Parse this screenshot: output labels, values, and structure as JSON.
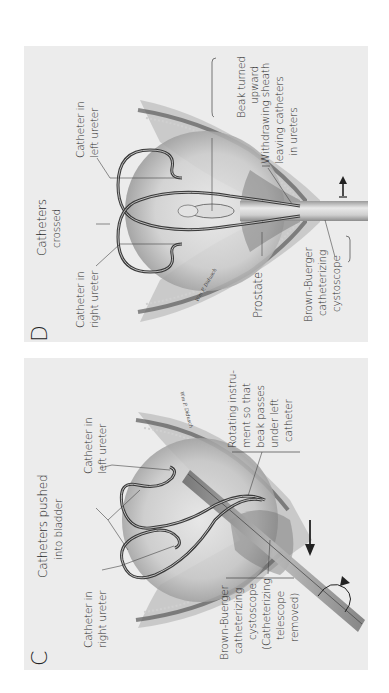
{
  "figure": {
    "orientation": "rotated-90-ccw",
    "background": "#ffffff",
    "panel_bg": "#ececec"
  },
  "panels": [
    {
      "letter": "D",
      "labels": {
        "catheters_crossed": [
          "Catheters",
          "crossed"
        ],
        "catheter_left_ureter": [
          "Catheter in",
          "left ureter"
        ],
        "catheter_right_ureter": [
          "Catheter in",
          "right ureter"
        ],
        "beak_turned_upward": [
          "Beak turned",
          "upward"
        ],
        "withdrawing_sheath": [
          "Withdrawing sheath",
          "leaving catheters",
          "in ureters"
        ],
        "prostate": [
          "Prostate"
        ],
        "cystoscope": [
          "Brown-Buerger",
          "catheterizing",
          "cystoscope"
        ]
      },
      "signature": "Wm P. Didusch"
    },
    {
      "letter": "C",
      "labels": {
        "catheters_pushed": [
          "Catheters pushed",
          "into bladder"
        ],
        "catheter_left_ureter": [
          "Catheter in",
          "left ureter"
        ],
        "catheter_right_ureter": [
          "Catheter in",
          "right ureter"
        ],
        "rotating_instrument": [
          "Rotating instru-",
          "ment so that",
          "beak passes",
          "under left",
          "catheter"
        ],
        "cystoscope": [
          "Brown-Buerger",
          "catheterizing",
          "cystoscope",
          "(Catheterizing",
          "telescope",
          "removed)"
        ]
      },
      "signature": "Wm P. Didusch"
    }
  ]
}
